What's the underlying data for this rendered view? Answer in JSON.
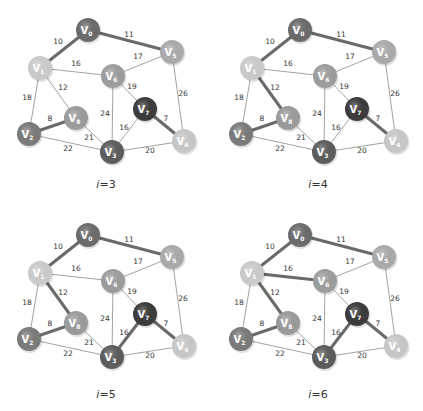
{
  "nodes": [
    {
      "id": "V0",
      "label": "V",
      "sub": "0",
      "x": 88,
      "y": 30,
      "color": "#6b6b6b"
    },
    {
      "id": "V1",
      "label": "V",
      "sub": "1",
      "x": 40,
      "y": 68,
      "color": "#c9c9c9"
    },
    {
      "id": "V2",
      "label": "V",
      "sub": "2",
      "x": 29,
      "y": 134,
      "color": "#7a7a7a"
    },
    {
      "id": "V3",
      "label": "V",
      "sub": "3",
      "x": 112,
      "y": 152,
      "color": "#5c5c5c"
    },
    {
      "id": "V4",
      "label": "V",
      "sub": "4",
      "x": 184,
      "y": 141,
      "color": "#c6c6c6"
    },
    {
      "id": "V5",
      "label": "V",
      "sub": "5",
      "x": 172,
      "y": 52,
      "color": "#a9a9a9"
    },
    {
      "id": "V6",
      "label": "V",
      "sub": "6",
      "x": 113,
      "y": 76,
      "color": "#9c9c9c"
    },
    {
      "id": "V7",
      "label": "V",
      "sub": "7",
      "x": 145,
      "y": 109,
      "color": "#3c3c3c"
    },
    {
      "id": "V8",
      "label": "V",
      "sub": "8",
      "x": 76,
      "y": 118,
      "color": "#9a9a9a"
    }
  ],
  "edges": [
    {
      "a": "V0",
      "b": "V1",
      "w": "10",
      "lx": 58,
      "ly": 44
    },
    {
      "a": "V0",
      "b": "V5",
      "w": "11",
      "lx": 129,
      "ly": 37
    },
    {
      "a": "V1",
      "b": "V6",
      "w": "16",
      "lx": 76,
      "ly": 66
    },
    {
      "a": "V6",
      "b": "V5",
      "w": "17",
      "lx": 138,
      "ly": 59
    },
    {
      "a": "V1",
      "b": "V8",
      "w": "12",
      "lx": 63,
      "ly": 90
    },
    {
      "a": "V1",
      "b": "V2",
      "w": "18",
      "lx": 27,
      "ly": 100
    },
    {
      "a": "V6",
      "b": "V7",
      "w": "19",
      "lx": 132,
      "ly": 89
    },
    {
      "a": "V5",
      "b": "V4",
      "w": "26",
      "lx": 183,
      "ly": 96
    },
    {
      "a": "V6",
      "b": "V3",
      "w": "24",
      "lx": 105,
      "ly": 116
    },
    {
      "a": "V2",
      "b": "V8",
      "w": "8",
      "lx": 50,
      "ly": 121
    },
    {
      "a": "V7",
      "b": "V4",
      "w": "7",
      "lx": 166,
      "ly": 121
    },
    {
      "a": "V7",
      "b": "V3",
      "w": "16",
      "lx": 124,
      "ly": 130
    },
    {
      "a": "V8",
      "b": "V3",
      "w": "21",
      "lx": 89,
      "ly": 140
    },
    {
      "a": "V2",
      "b": "V3",
      "w": "22",
      "lx": 68,
      "ly": 151
    },
    {
      "a": "V3",
      "b": "V4",
      "w": "20",
      "lx": 150,
      "ly": 153
    }
  ],
  "panels": [
    {
      "caption_var": "i",
      "caption_val": "=3",
      "x": 0,
      "y": 0,
      "tree": [
        "V0-V1",
        "V0-V5",
        "V2-V8",
        "V7-V4"
      ]
    },
    {
      "caption_var": "i",
      "caption_val": "=4",
      "x": 212,
      "y": 0,
      "tree": [
        "V0-V1",
        "V0-V5",
        "V2-V8",
        "V7-V4",
        "V1-V8"
      ]
    },
    {
      "caption_var": "i",
      "caption_val": "=5",
      "x": 0,
      "y": 205,
      "tree": [
        "V0-V1",
        "V0-V5",
        "V2-V8",
        "V7-V4",
        "V1-V8",
        "V7-V3"
      ]
    },
    {
      "caption_var": "i",
      "caption_val": "=6",
      "x": 212,
      "y": 205,
      "tree": [
        "V0-V1",
        "V0-V5",
        "V2-V8",
        "V7-V4",
        "V1-V8",
        "V7-V3",
        "V1-V6"
      ]
    }
  ],
  "style": {
    "thin_edge": "#8a8a8a",
    "thick_edge": "#6a6a6a",
    "label_color": "#333333"
  }
}
